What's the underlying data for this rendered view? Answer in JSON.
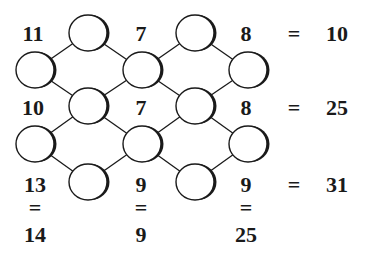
{
  "puzzle": {
    "row_clues": [
      {
        "left": "11",
        "mid": "7",
        "right": "8",
        "sum": "10"
      },
      {
        "left": "10",
        "mid": "7",
        "right": "8",
        "sum": "25"
      },
      {
        "left": "13",
        "mid": "9",
        "right": "9",
        "sum": "31"
      }
    ],
    "column_sums": [
      "14",
      "9",
      "25"
    ],
    "equals_sign": "=",
    "colors": {
      "ink": "#1a1a1a",
      "background": "#ffffff"
    },
    "circles": [
      {
        "id": "r1c1",
        "cx": 88,
        "cy": 33
      },
      {
        "id": "r1c2",
        "cx": 195,
        "cy": 33
      },
      {
        "id": "r2c1",
        "cx": 35,
        "cy": 70
      },
      {
        "id": "r2c2",
        "cx": 142,
        "cy": 70
      },
      {
        "id": "r2c3",
        "cx": 248,
        "cy": 70
      },
      {
        "id": "r3c1",
        "cx": 88,
        "cy": 106
      },
      {
        "id": "r3c2",
        "cx": 195,
        "cy": 106
      },
      {
        "id": "r4c1",
        "cx": 35,
        "cy": 144
      },
      {
        "id": "r4c2",
        "cx": 142,
        "cy": 144
      },
      {
        "id": "r4c3",
        "cx": 248,
        "cy": 144
      },
      {
        "id": "r5c1",
        "cx": 88,
        "cy": 182
      },
      {
        "id": "r5c2",
        "cx": 195,
        "cy": 182
      }
    ]
  }
}
